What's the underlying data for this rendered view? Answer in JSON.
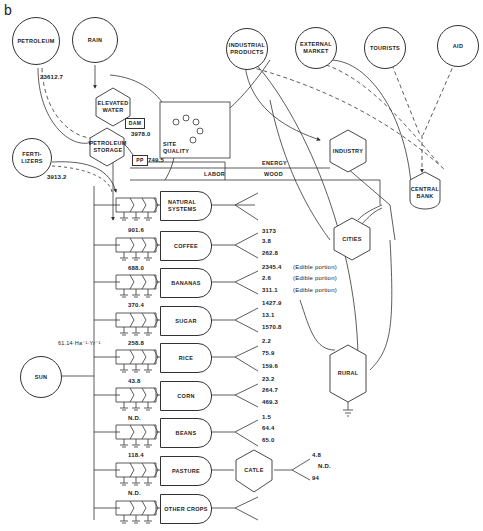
{
  "panel_label": "b",
  "sources": {
    "petroleum": "PETROLEUM",
    "rain": "RAIN",
    "industrial_products": "INDUSTRIAL PRODUCTS",
    "external_market": "EXTERNAL MARKET",
    "tourists": "TOURISTS",
    "aid": "AID",
    "fertilizers": "FERTI- LIZERS",
    "sun": "SUN"
  },
  "storages": {
    "elevated_water": "ELEVATED WATER",
    "petroleum_storage": "PETROLEUM STORAGE",
    "site_quality": "SITE QUALITY",
    "dam": "DAM",
    "pp": "PP"
  },
  "flows": {
    "petroleum": "23612.7",
    "dam": "3978.0",
    "pp": "749.5",
    "fertilizers": "3913.2",
    "sun": "61.14·Ha⁻¹·Yr⁻¹"
  },
  "lines": {
    "energy": "ENERGY",
    "labor": "LABOR",
    "wood": "WOOD"
  },
  "consumers": {
    "industry": "INDUSTRY",
    "central_bank": "CENTRAL BANK",
    "cities": "CITIES",
    "rural": "RURAL",
    "catle": "CATLE"
  },
  "crops": [
    {
      "name": "NATURAL SYSTEMS",
      "input": "",
      "outputs": []
    },
    {
      "name": "COFFEE",
      "input": "901.6",
      "outputs": [
        "3173",
        "3.8",
        "262.8"
      ]
    },
    {
      "name": "BANANAS",
      "input": "688.0",
      "outputs": [
        "2345.4",
        "2.6",
        "311.1"
      ],
      "notes": [
        "(Edible portion)",
        "(Edible portion)",
        "(Edible portion)"
      ]
    },
    {
      "name": "SUGAR",
      "input": "370.4",
      "outputs": [
        "1427.9",
        "13.1",
        "1570.8"
      ]
    },
    {
      "name": "RICE",
      "input": "258.8",
      "outputs": [
        "2.2",
        "75.9",
        "159.6"
      ]
    },
    {
      "name": "CORN",
      "input": "43.8",
      "outputs": [
        "23.2",
        "264.7",
        "469.3"
      ]
    },
    {
      "name": "BEANS",
      "input": "N.D.",
      "outputs": [
        "1.5",
        "64.4",
        "65.0"
      ]
    },
    {
      "name": "PASTURE",
      "input": "118.4",
      "outputs": []
    },
    {
      "name": "OTHER CROPS",
      "input": "N.D.",
      "outputs": []
    }
  ],
  "catle_outputs": [
    "4.8",
    "N.D.",
    "94"
  ]
}
